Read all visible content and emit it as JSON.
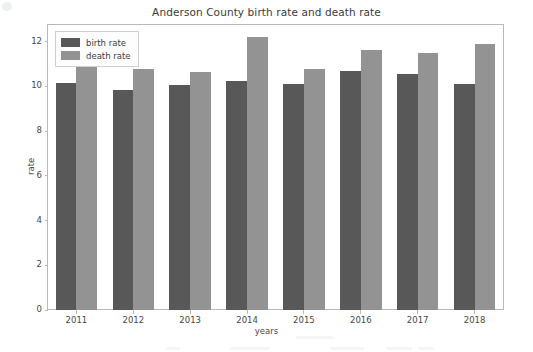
{
  "chart_data": {
    "type": "bar",
    "title": "Anderson County birth rate and death rate",
    "xlabel": "years",
    "ylabel": "rate",
    "categories": [
      "2011",
      "2012",
      "2013",
      "2014",
      "2015",
      "2016",
      "2017",
      "2018"
    ],
    "series": [
      {
        "name": "birth rate",
        "color": "#585858",
        "values": [
          10.15,
          9.85,
          10.05,
          10.25,
          10.1,
          10.7,
          10.55,
          10.1
        ]
      },
      {
        "name": "death rate",
        "color": "#939393",
        "values": [
          11.0,
          10.78,
          10.67,
          12.2,
          10.78,
          11.65,
          11.5,
          11.9
        ]
      }
    ],
    "ylim": [
      0,
      12.75
    ],
    "yticks": [
      "0",
      "2",
      "4",
      "6",
      "8",
      "10",
      "12"
    ],
    "ytick_values": [
      0,
      2,
      4,
      6,
      8,
      10,
      12
    ],
    "grid": false,
    "legend_position": "upper left"
  }
}
